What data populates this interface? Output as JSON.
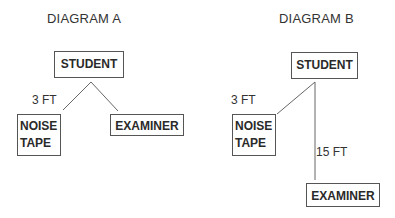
{
  "diagram_a": {
    "title": "DIAGRAM A",
    "student": "STUDENT",
    "noise_tape_line1": "NOISE",
    "noise_tape_line2": "TAPE",
    "examiner": "EXAMINER",
    "distance_label": "3 FT"
  },
  "diagram_b": {
    "title": "DIAGRAM B",
    "student": "STUDENT",
    "noise_tape_line1": "NOISE",
    "noise_tape_line2": "TAPE",
    "examiner": "EXAMINER",
    "distance_noise_label": "3 FT",
    "distance_examiner_label": "15 FT"
  },
  "colors": {
    "line": "#666666",
    "box_border": "#555555",
    "text": "#2a2a2a"
  }
}
